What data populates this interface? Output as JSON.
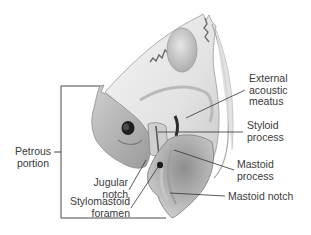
{
  "figure": {
    "colors": {
      "background": "#ffffff",
      "bone_light": "#ececec",
      "bone_mid": "#bdbdbd",
      "bone_dark": "#7a7a7a",
      "foramen": "#1e1e1e",
      "leader_line": "#333333",
      "text": "#3a3a3a"
    }
  },
  "labels": {
    "external_acoustic_meatus": {
      "line1": "External",
      "line2": "acoustic",
      "line3": "meatus"
    },
    "styloid_process": {
      "line1": "Styloid",
      "line2": "process"
    },
    "mastoid_process": {
      "line1": "Mastoid",
      "line2": "process"
    },
    "mastoid_notch": {
      "line1": "Mastoid notch"
    },
    "jugular_notch": {
      "line1": "Jugular",
      "line2": "notch"
    },
    "stylomastoid_foramen": {
      "line1": "Stylomastoid",
      "line2": "foramen"
    },
    "petrous_portion": {
      "line1": "Petrous",
      "line2": "portion"
    }
  }
}
